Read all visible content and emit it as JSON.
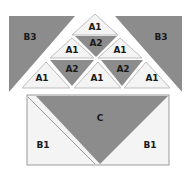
{
  "diagram": {
    "title": "",
    "top_block": {
      "left_corner": {
        "label": "B3",
        "fill": "grey"
      },
      "right_corner": {
        "label": "B3",
        "fill": "grey"
      },
      "pyramid": {
        "rows": [
          [
            {
              "label": "A1",
              "fill": "white"
            }
          ],
          [
            {
              "label": "A1",
              "fill": "white"
            },
            {
              "label": "A2",
              "fill": "grey"
            },
            {
              "label": "A1",
              "fill": "white"
            }
          ],
          [
            {
              "label": "A1",
              "fill": "white"
            },
            {
              "label": "A2",
              "fill": "grey"
            },
            {
              "label": "A1",
              "fill": "white"
            },
            {
              "label": "A2",
              "fill": "grey"
            },
            {
              "label": "A1",
              "fill": "white"
            }
          ]
        ]
      }
    },
    "bottom_block": {
      "center": {
        "label": "C",
        "fill": "grey"
      },
      "left": {
        "label": "B1",
        "fill": "white"
      },
      "right": {
        "label": "B1",
        "fill": "white"
      }
    },
    "colors": {
      "grey": "#8c8c8c",
      "white": "#f4f4f4"
    }
  }
}
